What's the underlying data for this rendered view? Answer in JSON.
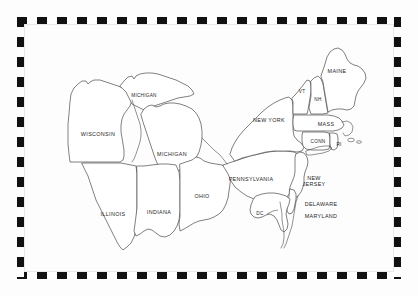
{
  "map": {
    "title": "Northeastern and Midwestern United States",
    "region": "Northeast / Midwest",
    "background_color": "#fdfdfd",
    "outline_color": "#4a4a4a",
    "label_color": "#1d1d1d",
    "border": {
      "style": "checkered",
      "colors": [
        "#111111",
        "#ffffff"
      ],
      "block_length_px": 10,
      "thickness_px": 7
    },
    "labels": [
      {
        "id": "michigan-up",
        "text": "MICHIGAN",
        "x": 120,
        "y": 72,
        "size": "sm"
      },
      {
        "id": "wisconsin",
        "text": "WISCONSIN",
        "x": 74,
        "y": 110,
        "size": "md"
      },
      {
        "id": "michigan-lp",
        "text": "MICHIGAN",
        "x": 148,
        "y": 130,
        "size": "md"
      },
      {
        "id": "illinois",
        "text": "ILLINOIS",
        "x": 89,
        "y": 190,
        "size": "md"
      },
      {
        "id": "indiana",
        "text": "INDIANA",
        "x": 135,
        "y": 188,
        "size": "md"
      },
      {
        "id": "ohio",
        "text": "OHIO",
        "x": 178,
        "y": 172,
        "size": "md"
      },
      {
        "id": "pennsylvania",
        "text": "PENNSYLVANIA",
        "x": 227,
        "y": 155,
        "size": "md"
      },
      {
        "id": "new-york",
        "text": "NEW YORK",
        "x": 245,
        "y": 96,
        "size": "md"
      },
      {
        "id": "vermont",
        "text": "VT",
        "x": 278,
        "y": 68,
        "size": "sm"
      },
      {
        "id": "new-hampshire",
        "text": "NH",
        "x": 294,
        "y": 76,
        "size": "sm"
      },
      {
        "id": "maine",
        "text": "MAINE",
        "x": 313,
        "y": 47,
        "size": "md"
      },
      {
        "id": "massachusetts",
        "text": "MASS",
        "x": 302,
        "y": 100,
        "size": "md"
      },
      {
        "id": "connecticut",
        "text": "CONN",
        "x": 294,
        "y": 118,
        "size": "sm"
      },
      {
        "id": "rhode-island",
        "text": "RI",
        "x": 315,
        "y": 121,
        "size": "sm"
      },
      {
        "id": "new-jersey",
        "text": "NEW\nJERSEY",
        "x": 290,
        "y": 157,
        "size": "md"
      },
      {
        "id": "delaware",
        "text": "DELAWARE",
        "x": 297,
        "y": 180,
        "size": "md"
      },
      {
        "id": "maryland",
        "text": "MARYLAND",
        "x": 297,
        "y": 192,
        "size": "md"
      },
      {
        "id": "district-of-columbia",
        "text": "DC",
        "x": 236,
        "y": 190,
        "size": "sm"
      }
    ],
    "states_listed": [
      "Michigan",
      "Wisconsin",
      "Illinois",
      "Indiana",
      "Ohio",
      "Pennsylvania",
      "New York",
      "Vermont",
      "New Hampshire",
      "Maine",
      "Massachusetts",
      "Connecticut",
      "Rhode Island",
      "New Jersey",
      "Delaware",
      "Maryland",
      "District of Columbia"
    ]
  }
}
